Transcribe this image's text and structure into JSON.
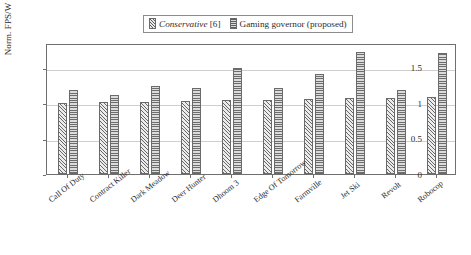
{
  "chart_data": {
    "type": "bar",
    "title": "",
    "xlabel": "",
    "ylabel": "Norm. FPS/W",
    "ylim": [
      0,
      1.85
    ],
    "yticks": [
      "0",
      "0.5",
      "1",
      "1.5"
    ],
    "ytick_values": [
      0,
      0.5,
      1,
      1.5
    ],
    "grid": true,
    "legend_position": "top-center",
    "categories": [
      "Call Of Duty",
      "Contract Killer",
      "Dark Meadow",
      "Deer Hunter",
      "Dhoom 3",
      "Edge Of Tomorrow",
      "Farmville",
      "Jet Ski",
      "Revolt",
      "Robocop"
    ],
    "series": [
      {
        "name": "Conservative [6]",
        "name_italic_part": "Conservative",
        "name_reference": "[6]",
        "pattern": "diagonal-hatch",
        "values": [
          1.0,
          1.01,
          1.02,
          1.03,
          1.04,
          1.05,
          1.06,
          1.07,
          1.08,
          1.09
        ]
      },
      {
        "name": "Gaming governor (proposed)",
        "pattern": "horizontal-hatch",
        "values": [
          1.18,
          1.12,
          1.25,
          1.22,
          1.5,
          1.21,
          1.41,
          1.72,
          1.19,
          1.71
        ]
      }
    ]
  },
  "legend": {
    "entries": [
      {
        "label_italic": "Conservative",
        "label_ref": " [6]",
        "swatch": "diagonal-hatch-swatch"
      },
      {
        "label": "Gaming governor (proposed)",
        "swatch": "horizontal-hatch-swatch"
      }
    ]
  }
}
